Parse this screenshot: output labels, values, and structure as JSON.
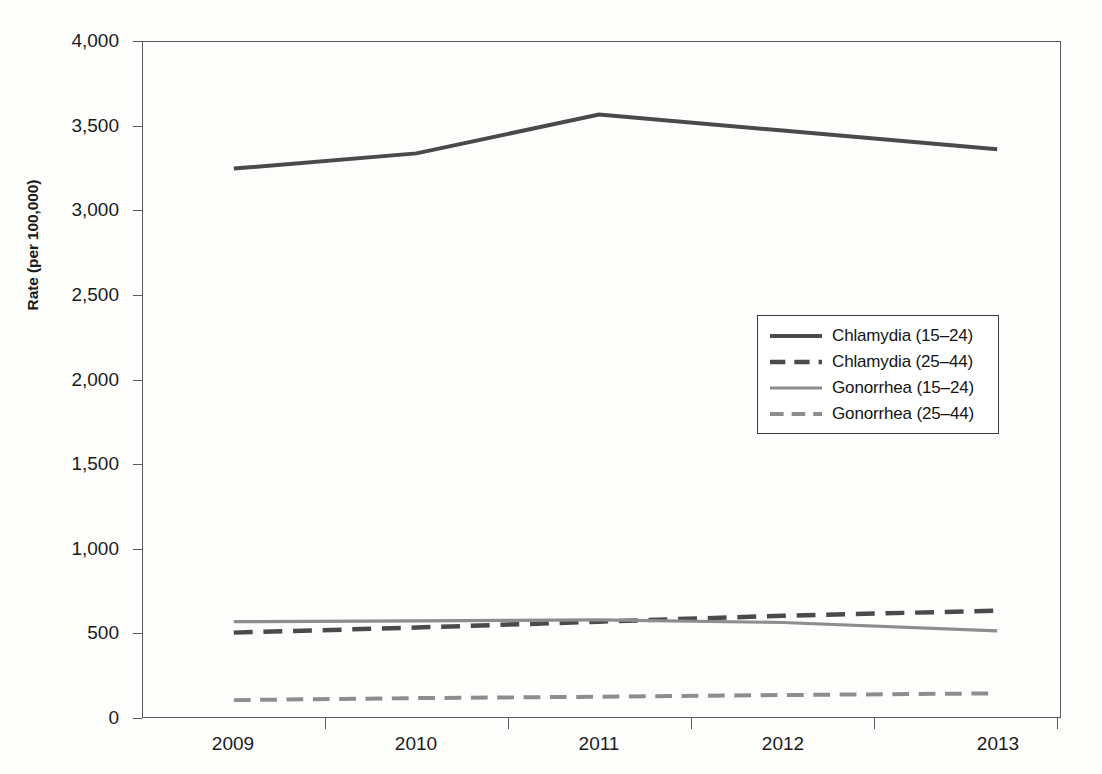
{
  "chart_data": {
    "type": "line",
    "title": "",
    "xlabel": "",
    "ylabel": "Rate (per 100,000)",
    "x": [
      2009,
      2010,
      2011,
      2012,
      2013
    ],
    "categories": [
      "2009",
      "2010",
      "2011",
      "2012",
      "2013"
    ],
    "xtick_labels": [
      "2009",
      "2010",
      "2011",
      "2012",
      "2013"
    ],
    "ytick_labels": [
      "0",
      "500",
      "1,000",
      "1,500",
      "2,000",
      "2,500",
      "3,000",
      "3,500",
      "4,000"
    ],
    "ytick_values": [
      0,
      500,
      1000,
      1500,
      2000,
      2500,
      3000,
      3500,
      4000
    ],
    "ylim": [
      0,
      4000
    ],
    "grid": false,
    "legend_position": "center-right",
    "series": [
      {
        "name": "Chlamydia (15–24)",
        "values": [
          3250,
          3340,
          3570,
          3475,
          3365
        ],
        "color": "#4a4a4a",
        "style": "solid",
        "width": 4
      },
      {
        "name": "Chlamydia (25–44)",
        "values": [
          500,
          530,
          565,
          600,
          630
        ],
        "color": "#4a4a4a",
        "style": "dashed",
        "width": 4.5
      },
      {
        "name": "Gonorrhea (15–24)",
        "values": [
          565,
          570,
          575,
          560,
          510
        ],
        "color": "#8d8d8d",
        "style": "solid",
        "width": 3.2
      },
      {
        "name": "Gonorrhea (25–44)",
        "values": [
          100,
          112,
          120,
          130,
          140
        ],
        "color": "#8d8d8d",
        "style": "dashed",
        "width": 4
      }
    ]
  },
  "axis": {
    "frame_color": "#5a5a5a"
  }
}
